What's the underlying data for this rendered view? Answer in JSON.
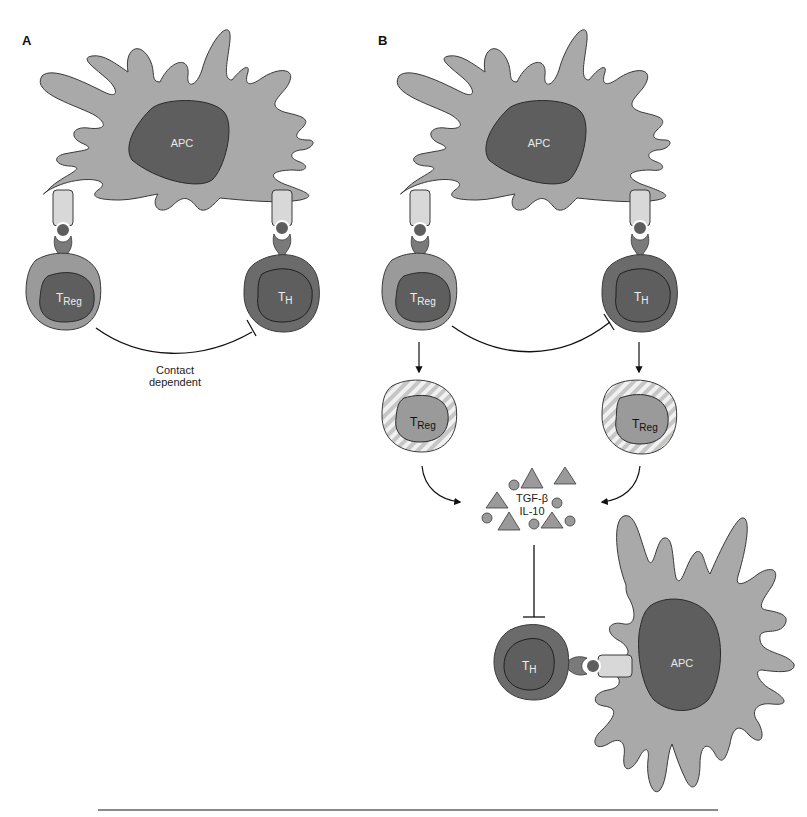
{
  "figure": {
    "panels": [
      {
        "id": "A",
        "label": "A",
        "apc_label": "APC",
        "cells": [
          {
            "name": "treg",
            "main": "T",
            "sub": "Reg"
          },
          {
            "name": "th",
            "main": "T",
            "sub": "H"
          }
        ],
        "interaction": {
          "type": "inhibition",
          "label_line1": "Contact",
          "label_line2": "dependent"
        }
      },
      {
        "id": "B",
        "label": "B",
        "apc_label": "APC",
        "cells_top": [
          {
            "name": "treg",
            "main": "T",
            "sub": "Reg"
          },
          {
            "name": "th",
            "main": "T",
            "sub": "H"
          }
        ],
        "cells_activated": [
          {
            "name": "treg-activated-left",
            "main": "T",
            "sub": "Reg"
          },
          {
            "name": "treg-activated-right",
            "main": "T",
            "sub": "Reg"
          }
        ],
        "cytokines": {
          "line1": "TGF-β",
          "line2": "IL-10"
        },
        "target_cell": {
          "main": "T",
          "sub": "H"
        },
        "target_apc_label": "APC"
      }
    ],
    "colors": {
      "apc_body": "#a9a9a9",
      "apc_nucleus": "#5e5e5e",
      "cell_dark": "#6b6b6b",
      "cell_light": "#9a9a9a",
      "receptor_light": "#d8d8d8",
      "outline": "#3a3a3a",
      "rule": "#8a8a8a"
    }
  }
}
